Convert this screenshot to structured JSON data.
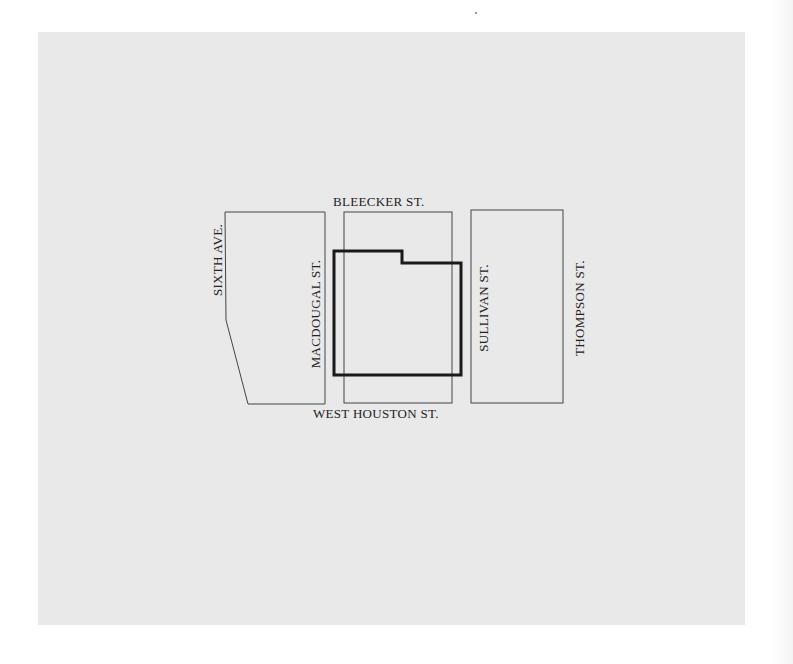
{
  "map": {
    "background_color": "#e9e9e9",
    "line_color": "#444444",
    "highlight_color": "#1a1a1a",
    "streets": {
      "north": "BLEECKER ST.",
      "south": "WEST HOUSTON ST.",
      "west_avenue": "SIXTH AVE.",
      "west_street": "MACDOUGAL ST.",
      "east_street": "SULLIVAN ST.",
      "far_east_street": "THOMPSON ST."
    },
    "blocks": [
      {
        "name": "west-block",
        "shape": "polygon with angled southwest corner"
      },
      {
        "name": "center-block",
        "shape": "rectangle"
      },
      {
        "name": "east-block",
        "shape": "rectangle"
      }
    ],
    "highlighted_site": {
      "shape": "notched outline",
      "style": "bold"
    }
  }
}
